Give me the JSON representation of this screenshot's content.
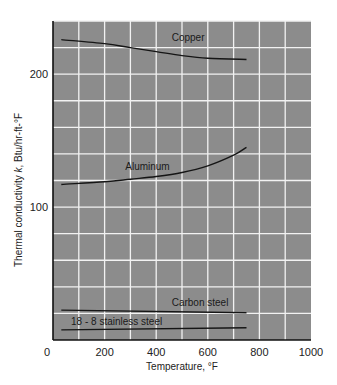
{
  "chart_data": {
    "type": "line",
    "title": "",
    "xlabel": "Temperature, °F",
    "ylabel": "Thermal conductivity k, Btu/hr-ft-°F",
    "ylabel_parts": [
      "Thermal conductivity ",
      "k",
      ", Btu/hr-ft-°F"
    ],
    "xlim": [
      0,
      1000
    ],
    "ylim": [
      0,
      240
    ],
    "x_ticks": [
      0,
      200,
      400,
      600,
      800,
      1000
    ],
    "x_tick_labels": [
      "0",
      "200",
      "400",
      "600",
      "800",
      "1000"
    ],
    "y_ticks": [
      100,
      200
    ],
    "y_tick_labels": [
      "100",
      "200"
    ],
    "grid": {
      "on": true,
      "x_step": 100,
      "y_step": 20
    },
    "legend": "inline labels on curves",
    "series": [
      {
        "name": "Copper",
        "x": [
          32,
          200,
          300,
          400,
          500,
          600,
          750
        ],
        "values": [
          226,
          223,
          220,
          217,
          214,
          212,
          211
        ],
        "label_pos": {
          "x": 460,
          "y": 225
        }
      },
      {
        "name": "Aluminum",
        "x": [
          32,
          200,
          300,
          400,
          500,
          600,
          700,
          750
        ],
        "values": [
          117,
          119,
          121,
          123,
          126,
          131,
          139,
          145
        ],
        "label_pos": {
          "x": 280,
          "y": 128
        }
      },
      {
        "name": "Carbon steel",
        "x": [
          32,
          750
        ],
        "values": [
          22.5,
          20.5
        ],
        "label_pos": {
          "x": 460,
          "y": 25.5
        }
      },
      {
        "name": "18 - 8 stainless steel",
        "x": [
          32,
          750
        ],
        "values": [
          7.6,
          9.2
        ],
        "label_pos": {
          "x": 70,
          "y": 11.5
        }
      }
    ]
  },
  "colors": {
    "plot_fill": "#8c8c8c",
    "grid_line": "#f2f2f2",
    "axis_line": "#111111",
    "curve": "#151515",
    "background": "#ffffff"
  }
}
